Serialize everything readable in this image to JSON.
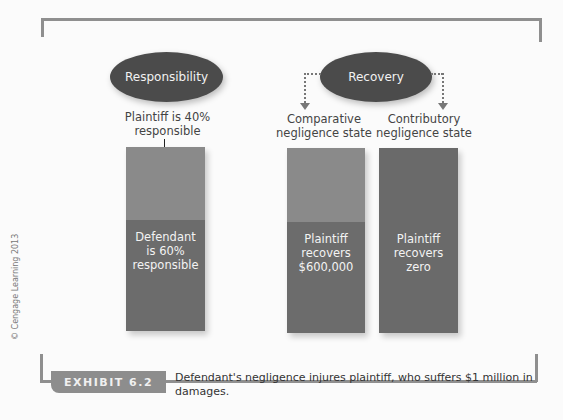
{
  "responsibility": {
    "title": "Responsibility",
    "plaintiff_caption": "Plaintiff is 40% responsible",
    "bar": {
      "top_share_pct": 40,
      "bottom_share_pct": 60,
      "bottom_label_lines": [
        "Defendant",
        "is 60%",
        "responsible"
      ]
    }
  },
  "recovery": {
    "title": "Recovery",
    "comparative": {
      "caption_lines": [
        "Comparative",
        "negligence state"
      ],
      "bar_label_lines": [
        "Plaintiff",
        "recovers",
        "$600,000"
      ],
      "top_share_pct": 40,
      "bottom_share_pct": 60
    },
    "contributory": {
      "caption_lines": [
        "Contributory",
        "negligence state"
      ],
      "bar_label_lines": [
        "Plaintiff",
        "recovers",
        "zero"
      ]
    }
  },
  "exhibit": {
    "label": "EXHIBIT 6.2",
    "caption": "Defendant's negligence injures plaintiff, who suffers $1 million in damages."
  },
  "copyright": "© Cengage Learning 2013",
  "colors": {
    "ellipse": "#4b4b4b",
    "bar_light": "#8a8a8a",
    "bar_dark": "#6c6c6c",
    "frame": "#8f8f8f"
  }
}
